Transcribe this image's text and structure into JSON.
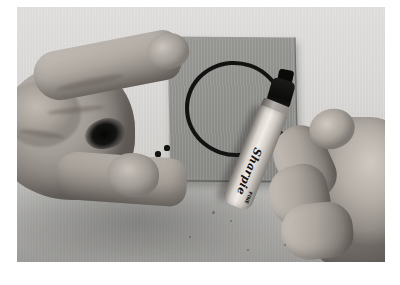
{
  "image": {
    "kind": "photograph",
    "palette": "grayscale",
    "caption": "Two hands over a light gray surface: the left hand holds a gray index card while the right hand draws on it with a Sharpie marker.",
    "print_border_color": "#ffffff",
    "backdrop_color": "#d6d5d3",
    "surface_color": "#a5a4a1",
    "skin_color": "#ada7a0",
    "ink_color": "#121211"
  },
  "card": {
    "label": "gray index card",
    "fill_color": "#8e8e8b",
    "edge_color": "#4b4b49"
  },
  "drawing": {
    "circle_label": "hand-drawn ink circle",
    "circle_color": "#121211",
    "lead_line_label": "ink stroke to marker nib",
    "dotted_trail_label": "dotted ink trail",
    "dot_count": 7,
    "dots": [
      {
        "x": 150,
        "y": 141,
        "r": 2.6
      },
      {
        "x": 141,
        "y": 147,
        "r": 2.6
      },
      {
        "x": 131,
        "y": 152,
        "r": 2.4
      },
      {
        "x": 120,
        "y": 157,
        "r": 2.3
      },
      {
        "x": 109,
        "y": 162,
        "r": 2.2
      },
      {
        "x": 97,
        "y": 167,
        "r": 2.0
      },
      {
        "x": 84,
        "y": 172,
        "r": 1.9
      }
    ]
  },
  "left_hand": {
    "label": "left hand holding card",
    "parts": [
      "palm",
      "index finger",
      "thumb",
      "shadow gap"
    ]
  },
  "right_hand": {
    "label": "right hand holding marker",
    "parts": [
      "back of hand",
      "index finger",
      "middle finger",
      "ring finger",
      "thumb tip"
    ]
  },
  "marker": {
    "brand": "Sharpie",
    "sub_mark": "FINE",
    "body_color": "#ece7e2",
    "cap_color": "#0d0d0c",
    "label": "permanent marker"
  },
  "specks": [
    {
      "x": 196,
      "y": 205,
      "r": 1.5
    },
    {
      "x": 214,
      "y": 214,
      "r": 1.2
    },
    {
      "x": 231,
      "y": 243,
      "r": 1.3
    },
    {
      "x": 268,
      "y": 238,
      "r": 1.1
    },
    {
      "x": 173,
      "y": 230,
      "r": 1.0
    }
  ]
}
